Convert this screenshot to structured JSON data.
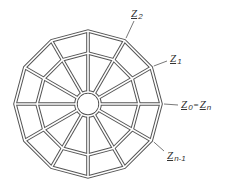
{
  "diagram": {
    "sides": 12,
    "stroke_color": "#555555",
    "labels": [
      {
        "id": "z2",
        "symbol": "Z",
        "subscript": "2"
      },
      {
        "id": "z1",
        "symbol": "Z",
        "subscript": "1"
      },
      {
        "id": "z0",
        "symbol": "Z",
        "subscript": "0",
        "equals_symbol": "Z",
        "equals_subscript": "n",
        "equals_sign": "="
      },
      {
        "id": "zn1",
        "symbol": "Z",
        "subscript": "n-1"
      }
    ]
  }
}
